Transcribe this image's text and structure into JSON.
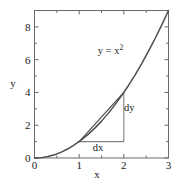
{
  "chart_data": {
    "type": "line",
    "title": "",
    "subtitle": "",
    "xlabel": "x",
    "ylabel": "y",
    "xlim": [
      0,
      3
    ],
    "ylim": [
      0,
      9
    ],
    "grid": false,
    "legend": false,
    "frame": "box",
    "tick_direction": "in",
    "x_ticks": [
      0,
      1,
      2,
      3
    ],
    "x_tick_labels": [
      "0",
      "1",
      "2",
      "3"
    ],
    "x_minor_ticks": [
      0.5,
      1.5,
      2.5
    ],
    "y_ticks": [
      0,
      2,
      4,
      6,
      8
    ],
    "y_tick_labels": [
      "0",
      "2",
      "4",
      "6",
      "8"
    ],
    "y_minor_ticks": [
      1,
      3,
      5,
      7,
      9
    ],
    "series": [
      {
        "name": "y = x^2",
        "kind": "curve",
        "formula": "y = x*x",
        "x": [
          0,
          0.15,
          0.3,
          0.45,
          0.6,
          0.75,
          0.9,
          1.05,
          1.2,
          1.35,
          1.5,
          1.65,
          1.8,
          1.95,
          2.1,
          2.25,
          2.4,
          2.55,
          2.7,
          2.85,
          3
        ],
        "values": [
          0,
          0.0225,
          0.09,
          0.2025,
          0.36,
          0.5625,
          0.81,
          1.1025,
          1.44,
          1.8225,
          2.25,
          2.7225,
          3.24,
          3.8025,
          4.41,
          5.0625,
          5.76,
          6.5025,
          7.29,
          8.1225,
          9
        ],
        "color": "#4d4d4d"
      },
      {
        "name": "secant",
        "kind": "segment",
        "x": [
          1,
          2
        ],
        "values": [
          1,
          4
        ],
        "color": "#4d4d4d"
      },
      {
        "name": "dx-leg",
        "kind": "segment",
        "x": [
          1,
          2
        ],
        "values": [
          1,
          1
        ],
        "color": "#808080"
      },
      {
        "name": "dy-leg",
        "kind": "segment",
        "x": [
          2,
          2
        ],
        "values": [
          1,
          4
        ],
        "color": "#808080"
      }
    ],
    "annotations": [
      {
        "name": "curve-label",
        "text_main": "y = x",
        "text_sup": "2",
        "x": 1.7,
        "y": 6.35
      },
      {
        "name": "dy-label",
        "text_main": "dy",
        "text_sup": "",
        "x": 2.12,
        "y": 2.85
      },
      {
        "name": "dx-label",
        "text_main": "dx",
        "text_sup": "",
        "x": 1.42,
        "y": 0.45
      }
    ],
    "colors": {
      "curve": "#4d4d4d",
      "secant": "#4d4d4d",
      "triangle": "#808080",
      "axis": "#6b6b6b",
      "text": "#1a1a1a",
      "background": "#ffffff"
    }
  },
  "figure": {
    "axis_title_x": "x",
    "axis_title_y": "y"
  }
}
